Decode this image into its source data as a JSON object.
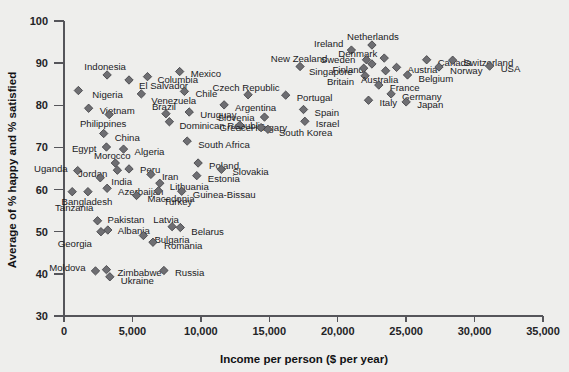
{
  "chart_data": {
    "type": "scatter",
    "title": "",
    "xlabel": "Income per person ($ per year)",
    "ylabel": "Average of % happy and % satisfied",
    "xlim": [
      0,
      35000
    ],
    "ylim": [
      30,
      100
    ],
    "xticks": [
      0,
      5000,
      10000,
      15000,
      20000,
      25000,
      30000,
      35000
    ],
    "xticklabels": [
      "0",
      "5,000",
      "10,000",
      "15,000",
      "20,000",
      "25,000",
      "30,000",
      "35,000"
    ],
    "yticks": [
      30,
      40,
      50,
      60,
      70,
      80,
      90,
      100
    ],
    "yticklabels": [
      "30",
      "40",
      "50",
      "60",
      "70",
      "80",
      "90",
      "100"
    ],
    "grid": false,
    "legend": false,
    "marker": "diamond",
    "marker_color": "#6e6e72",
    "points": [
      {
        "label": "Nigeria",
        "x": 1050,
        "y": 83.5,
        "lx": 14,
        "ly": 4,
        "anchor": "start"
      },
      {
        "label": "Indonesia",
        "x": 3150,
        "y": 87.2,
        "lx": -2,
        "ly": -8,
        "anchor": "middle"
      },
      {
        "label": "El Salvador",
        "x": 4750,
        "y": 86.0,
        "lx": 10,
        "ly": 6,
        "anchor": "start"
      },
      {
        "label": "Columbia",
        "x": 6100,
        "y": 86.8,
        "lx": 10,
        "ly": 3,
        "anchor": "start"
      },
      {
        "label": "Mexico",
        "x": 8450,
        "y": 88.0,
        "lx": 11,
        "ly": 2,
        "anchor": "start"
      },
      {
        "label": "Venezuela",
        "x": 5650,
        "y": 82.7,
        "lx": 10,
        "ly": 7,
        "anchor": "start"
      },
      {
        "label": "Chile",
        "x": 8800,
        "y": 83.3,
        "lx": 11,
        "ly": 3,
        "anchor": "start"
      },
      {
        "label": "Vietnam",
        "x": 1800,
        "y": 79.3,
        "lx": 11,
        "ly": 3,
        "anchor": "start"
      },
      {
        "label": "Brazil",
        "x": 7450,
        "y": 78.0,
        "lx": -2,
        "ly": -7,
        "anchor": "middle"
      },
      {
        "label": "Uruguay",
        "x": 9150,
        "y": 78.4,
        "lx": 11,
        "ly": 3,
        "anchor": "start"
      },
      {
        "label": "Philippines",
        "x": 3300,
        "y": 77.8,
        "lx": -6,
        "ly": 9,
        "anchor": "middle"
      },
      {
        "label": "Dominican Republic",
        "x": 7700,
        "y": 76.1,
        "lx": 10,
        "ly": 4,
        "anchor": "start"
      },
      {
        "label": "China",
        "x": 2900,
        "y": 73.3,
        "lx": 11,
        "ly": 4,
        "anchor": "start"
      },
      {
        "label": "Egypt",
        "x": 3100,
        "y": 70.1,
        "lx": -10,
        "ly": 2,
        "anchor": "end"
      },
      {
        "label": "Algeria",
        "x": 4350,
        "y": 69.6,
        "lx": 11,
        "ly": 3,
        "anchor": "start"
      },
      {
        "label": "South Africa",
        "x": 9000,
        "y": 71.5,
        "lx": 11,
        "ly": 4,
        "anchor": "start"
      },
      {
        "label": "Morocco",
        "x": 3750,
        "y": 66.3,
        "lx": -3,
        "ly": -7,
        "anchor": "middle"
      },
      {
        "label": "Uganda",
        "x": 1000,
        "y": 64.5,
        "lx": -10,
        "ly": -2,
        "anchor": "end"
      },
      {
        "label": "Jordan",
        "x": 3900,
        "y": 64.6,
        "lx": -10,
        "ly": 4,
        "anchor": "end"
      },
      {
        "label": "Peru",
        "x": 4750,
        "y": 64.9,
        "lx": 11,
        "ly": 1,
        "anchor": "start"
      },
      {
        "label": "Iran",
        "x": 6350,
        "y": 63.6,
        "lx": 11,
        "ly": 3,
        "anchor": "start"
      },
      {
        "label": "Poland",
        "x": 9800,
        "y": 66.3,
        "lx": 11,
        "ly": 3,
        "anchor": "start"
      },
      {
        "label": "Slovakia",
        "x": 11500,
        "y": 64.8,
        "lx": 11,
        "ly": 3,
        "anchor": "start"
      },
      {
        "label": "Estonia",
        "x": 9700,
        "y": 63.3,
        "lx": 11,
        "ly": 3,
        "anchor": "start"
      },
      {
        "label": "India",
        "x": 2650,
        "y": 62.8,
        "lx": 11,
        "ly": 4,
        "anchor": "start"
      },
      {
        "label": "Lithuania",
        "x": 7000,
        "y": 61.5,
        "lx": 10,
        "ly": 4,
        "anchor": "start"
      },
      {
        "label": "Azerbaijan",
        "x": 3150,
        "y": 60.3,
        "lx": 11,
        "ly": 4,
        "anchor": "start"
      },
      {
        "label": "Turkey",
        "x": 6900,
        "y": 59.7,
        "lx": 5,
        "ly": 11,
        "anchor": "start"
      },
      {
        "label": "Bangladesh",
        "x": 1750,
        "y": 59.5,
        "lx": -1,
        "ly": 10,
        "anchor": "middle"
      },
      {
        "label": "Tanzania",
        "x": 600,
        "y": 59.5,
        "lx": 2,
        "ly": 16,
        "anchor": "middle"
      },
      {
        "label": "Macedonia",
        "x": 5300,
        "y": 58.6,
        "lx": 11,
        "ly": 4,
        "anchor": "start"
      },
      {
        "label": "Guinea-Bissau",
        "x": 8600,
        "y": 59.6,
        "lx": 11,
        "ly": 4,
        "anchor": "start"
      },
      {
        "label": "Pakistan",
        "x": 2450,
        "y": 52.6,
        "lx": 10,
        "ly": -1,
        "anchor": "start"
      },
      {
        "label": "Latvia",
        "x": 7900,
        "y": 51.2,
        "lx": -6,
        "ly": -7,
        "anchor": "middle"
      },
      {
        "label": "Albania",
        "x": 3200,
        "y": 50.4,
        "lx": 10,
        "ly": 1,
        "anchor": "start"
      },
      {
        "label": "Belarus",
        "x": 8500,
        "y": 51.0,
        "lx": 11,
        "ly": 4,
        "anchor": "start"
      },
      {
        "label": "Georgia",
        "x": 2700,
        "y": 50.0,
        "lx": -9,
        "ly": 12,
        "anchor": "end"
      },
      {
        "label": "Bulgaria",
        "x": 5800,
        "y": 49.1,
        "lx": 11,
        "ly": 4,
        "anchor": "start"
      },
      {
        "label": "Romania",
        "x": 6500,
        "y": 47.5,
        "lx": 11,
        "ly": 4,
        "anchor": "start"
      },
      {
        "label": "Moldova",
        "x": 2300,
        "y": 40.7,
        "lx": -10,
        "ly": -3,
        "anchor": "end"
      },
      {
        "label": "Zimbabwe",
        "x": 3100,
        "y": 41.0,
        "lx": 11,
        "ly": 3,
        "anchor": "start"
      },
      {
        "label": "Ukraine",
        "x": 3350,
        "y": 39.3,
        "lx": 11,
        "ly": 4,
        "anchor": "start"
      },
      {
        "label": "Russia",
        "x": 7300,
        "y": 40.8,
        "lx": 11,
        "ly": 3,
        "anchor": "start"
      },
      {
        "label": "Argentina",
        "x": 11700,
        "y": 80.1,
        "lx": 11,
        "ly": 3,
        "anchor": "start"
      },
      {
        "label": "Czech Republic",
        "x": 13450,
        "y": 82.5,
        "lx": -2,
        "ly": -7,
        "anchor": "middle"
      },
      {
        "label": "Hungary",
        "x": 12850,
        "y": 75.3,
        "lx": 11,
        "ly": 3,
        "anchor": "start"
      },
      {
        "label": "Slovenia",
        "x": 14650,
        "y": 77.2,
        "lx": -10,
        "ly": 1,
        "anchor": "end"
      },
      {
        "label": "Greece",
        "x": 14400,
        "y": 74.7,
        "lx": -10,
        "ly": 0,
        "anchor": "end"
      },
      {
        "label": "South Korea",
        "x": 14900,
        "y": 74.3,
        "lx": 11,
        "ly": 4,
        "anchor": "start"
      },
      {
        "label": "Portugal",
        "x": 16200,
        "y": 82.4,
        "lx": 11,
        "ly": 3,
        "anchor": "start"
      },
      {
        "label": "Spain",
        "x": 17500,
        "y": 79.0,
        "lx": 11,
        "ly": 3,
        "anchor": "start"
      },
      {
        "label": "Israel",
        "x": 17600,
        "y": 76.2,
        "lx": 11,
        "ly": 3,
        "anchor": "start"
      },
      {
        "label": "New Zealand",
        "x": 17250,
        "y": 89.2,
        "lx": -1,
        "ly": -8,
        "anchor": "middle"
      },
      {
        "label": "Ireland",
        "x": 21000,
        "y": 93.1,
        "lx": -8,
        "ly": -6,
        "anchor": "end"
      },
      {
        "label": "Netherlands",
        "x": 22500,
        "y": 94.3,
        "lx": 1,
        "ly": -8,
        "anchor": "middle"
      },
      {
        "label": "Denmark",
        "x": 23400,
        "y": 91.2,
        "lx": -7,
        "ly": -4,
        "anchor": "end"
      },
      {
        "label": "Sweden",
        "x": 22100,
        "y": 90.8,
        "lx": -11,
        "ly": 0,
        "anchor": "end"
      },
      {
        "label": "Finland",
        "x": 22500,
        "y": 89.8,
        "lx": -8,
        "ly": 6,
        "anchor": "end"
      },
      {
        "label": "Singapore",
        "x": 21900,
        "y": 88.8,
        "lx": -11,
        "ly": 4,
        "anchor": "end"
      },
      {
        "label": "Britain",
        "x": 22000,
        "y": 87.0,
        "lx": -11,
        "ly": 6,
        "anchor": "end"
      },
      {
        "label": "Australia",
        "x": 23500,
        "y": 88.2,
        "lx": -6,
        "ly": 9,
        "anchor": "middle"
      },
      {
        "label": "Austria",
        "x": 24300,
        "y": 89.0,
        "lx": 11,
        "ly": 3,
        "anchor": "start"
      },
      {
        "label": "Canada",
        "x": 26500,
        "y": 90.8,
        "lx": 11,
        "ly": 3,
        "anchor": "start"
      },
      {
        "label": "Belgium",
        "x": 25100,
        "y": 87.2,
        "lx": 11,
        "ly": 4,
        "anchor": "start"
      },
      {
        "label": "Switzerland",
        "x": 28400,
        "y": 90.7,
        "lx": 11,
        "ly": 3,
        "anchor": "start"
      },
      {
        "label": "Norway",
        "x": 27400,
        "y": 89.1,
        "lx": 11,
        "ly": 4,
        "anchor": "start"
      },
      {
        "label": "USA",
        "x": 31100,
        "y": 89.3,
        "lx": 11,
        "ly": 3,
        "anchor": "start"
      },
      {
        "label": "France",
        "x": 23000,
        "y": 84.8,
        "lx": 11,
        "ly": 3,
        "anchor": "start"
      },
      {
        "label": "Germany",
        "x": 23900,
        "y": 82.7,
        "lx": 11,
        "ly": 3,
        "anchor": "start"
      },
      {
        "label": "Italy",
        "x": 22250,
        "y": 81.2,
        "lx": 11,
        "ly": 3,
        "anchor": "start"
      },
      {
        "label": "Japan",
        "x": 25000,
        "y": 80.8,
        "lx": 11,
        "ly": 3,
        "anchor": "start"
      }
    ]
  }
}
